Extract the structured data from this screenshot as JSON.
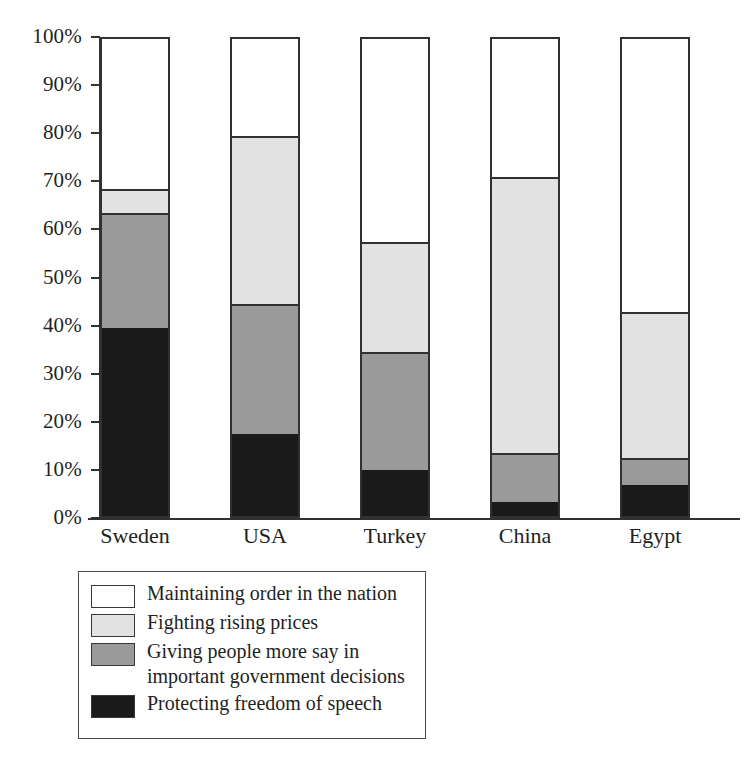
{
  "chart_data": {
    "type": "bar",
    "subtype": "stacked-percentage",
    "title": "",
    "xlabel": "",
    "ylabel": "",
    "ylim": [
      0,
      100
    ],
    "grid": false,
    "legend_position": "below-plot-left",
    "categories": [
      "Sweden",
      "USA",
      "Turkey",
      "China",
      "Egypt"
    ],
    "ytick_labels": [
      "100%",
      "90%",
      "80%",
      "70%",
      "60%",
      "50%",
      "40%",
      "30%",
      "20%",
      "10%",
      "0%"
    ],
    "ytick_values": [
      100,
      90,
      80,
      70,
      60,
      50,
      40,
      30,
      20,
      10,
      0
    ],
    "series": [
      {
        "name": "Maintaining order in the nation",
        "color": "#ffffff",
        "values": [
          32.0,
          21.0,
          43.0,
          29.5,
          57.5
        ]
      },
      {
        "name": "Fighting rising prices",
        "color": "#e2e2e2",
        "values": [
          5.0,
          35.0,
          23.0,
          57.5,
          30.5
        ]
      },
      {
        "name": "Giving people more say in\nimportant government decisions",
        "color": "#9a9a9a",
        "values": [
          24.0,
          27.0,
          24.5,
          10.0,
          5.5
        ]
      },
      {
        "name": "Protecting freedom of speech",
        "color": "#1a1a1a",
        "values": [
          39.0,
          17.0,
          9.5,
          3.0,
          6.5
        ]
      }
    ],
    "cumulative_tops": {
      "Sweden": {
        "black": 39.0,
        "gray": 63.0,
        "light_gray": 68.0,
        "white": 100.0
      },
      "USA": {
        "black": 17.0,
        "gray": 44.0,
        "light_gray": 79.0,
        "white": 100.0
      },
      "Turkey": {
        "black": 9.5,
        "gray": 34.0,
        "light_gray": 57.0,
        "white": 100.0
      },
      "China": {
        "black": 3.0,
        "gray": 13.0,
        "light_gray": 70.5,
        "white": 100.0
      },
      "Egypt": {
        "black": 6.5,
        "gray": 12.0,
        "light_gray": 42.5,
        "white": 100.0
      }
    }
  },
  "legend": {
    "items": [
      {
        "label": "Maintaining order in the nation",
        "color": "#ffffff"
      },
      {
        "label": "Fighting rising prices",
        "color": "#e2e2e2"
      },
      {
        "label": "Giving people more say in\nimportant government decisions",
        "color": "#9a9a9a"
      },
      {
        "label": "Protecting freedom of speech",
        "color": "#1a1a1a"
      }
    ]
  },
  "colors": {
    "axis": "#33312f",
    "text": "#231f1e",
    "background": "#ffffff",
    "series_white": "#ffffff",
    "series_light_gray": "#e2e2e2",
    "series_gray": "#9a9a9a",
    "series_black": "#1a1a1a"
  }
}
